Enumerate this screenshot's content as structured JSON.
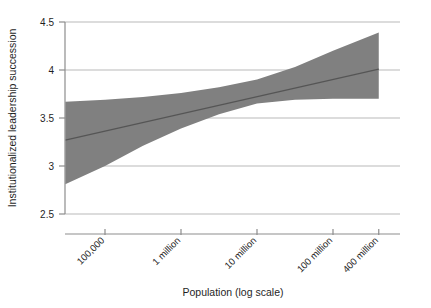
{
  "page": {
    "running_head": "",
    "page_number": ""
  },
  "chart_data": {
    "type": "line",
    "title": "",
    "subtitle": "",
    "xlabel": "Population (log scale)",
    "ylabel": "Institutionalized leadership succession",
    "xscale": "log",
    "yscale": "linear",
    "ylim": [
      2.5,
      4.5
    ],
    "ytick_labels": [
      "4.5",
      "4",
      "3.5",
      "3",
      "2.5"
    ],
    "ytick_values": [
      4.5,
      4,
      3.5,
      3,
      2.5
    ],
    "xtick_labels": [
      "100,000",
      "1 million",
      "10 million",
      "100 million",
      "400 million"
    ],
    "xtick_values": [
      100000,
      1000000,
      10000000,
      100000000,
      400000000
    ],
    "xtick_rotation_deg": 45,
    "grid": "horizontal",
    "legend": "none",
    "series": [
      {
        "name": "Predicted institutionalized leadership succession",
        "type": "line",
        "color": "#555555",
        "x": [
          30000,
          100000,
          316228,
          1000000,
          3162278,
          10000000,
          31622777,
          100000000,
          400000000
        ],
        "values": [
          3.27,
          3.36,
          3.47,
          3.58,
          3.68,
          3.78,
          3.86,
          3.94,
          4.01
        ]
      },
      {
        "name": "95% confidence interval (upper)",
        "type": "band-edge",
        "color": "#808080",
        "x": [
          30000,
          100000,
          316228,
          1000000,
          3162278,
          10000000,
          31622777,
          100000000,
          400000000
        ],
        "values": [
          3.67,
          3.69,
          3.72,
          3.76,
          3.82,
          3.9,
          4.03,
          4.2,
          4.39
        ]
      },
      {
        "name": "95% confidence interval (lower)",
        "type": "band-edge",
        "color": "#808080",
        "x": [
          30000,
          100000,
          316228,
          1000000,
          3162278,
          10000000,
          31622777,
          100000000,
          400000000
        ],
        "values": [
          2.81,
          3.0,
          3.21,
          3.39,
          3.54,
          3.65,
          3.69,
          3.7,
          3.7
        ]
      }
    ],
    "band_fill_color": "#808080",
    "line_color": "#555555",
    "gridline_color": "#b9b9b9",
    "axis_color": "#8d8d8d",
    "background_color": "#ffffff"
  }
}
